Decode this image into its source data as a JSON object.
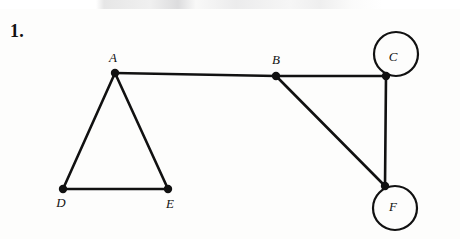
{
  "figure": {
    "problem_number": "1.",
    "type": "undirected-graph-diagram",
    "ink_color": "#111111",
    "background_color": "#fdfdfc"
  },
  "graph": {
    "vertices": [
      {
        "id": "A",
        "label": "A",
        "x": 115,
        "y": 73,
        "label_x": 113,
        "label_y": 62,
        "label_anchor": "middle",
        "loop": false
      },
      {
        "id": "B",
        "label": "B",
        "x": 276,
        "y": 76,
        "label_x": 276,
        "label_y": 64,
        "label_anchor": "middle",
        "loop": false
      },
      {
        "id": "C",
        "label": "C",
        "x": 386,
        "y": 76,
        "label_x": 393,
        "label_y": 61,
        "label_anchor": "middle",
        "loop": true,
        "loop_cx": 396,
        "loop_cy": 54,
        "loop_r": 22
      },
      {
        "id": "D",
        "label": "D",
        "x": 63,
        "y": 189,
        "label_x": 61,
        "label_y": 207,
        "label_anchor": "middle",
        "loop": false
      },
      {
        "id": "E",
        "label": "E",
        "x": 168,
        "y": 189,
        "label_x": 170,
        "label_y": 208,
        "label_anchor": "middle",
        "loop": false
      },
      {
        "id": "F",
        "label": "F",
        "x": 385,
        "y": 186,
        "label_x": 393,
        "label_y": 211,
        "label_anchor": "middle",
        "loop": true,
        "loop_cx": 395,
        "loop_cy": 208,
        "loop_r": 22
      }
    ],
    "edges": [
      {
        "from": "A",
        "to": "B",
        "x1": 115,
        "y1": 73,
        "x2": 276,
        "y2": 76
      },
      {
        "from": "A",
        "to": "D",
        "x1": 115,
        "y1": 73,
        "x2": 63,
        "y2": 189
      },
      {
        "from": "A",
        "to": "E",
        "x1": 115,
        "y1": 73,
        "x2": 168,
        "y2": 189
      },
      {
        "from": "D",
        "to": "E",
        "x1": 63,
        "y1": 189,
        "x2": 168,
        "y2": 189
      },
      {
        "from": "B",
        "to": "C",
        "x1": 276,
        "y1": 76,
        "x2": 386,
        "y2": 76
      },
      {
        "from": "B",
        "to": "F",
        "x1": 276,
        "y1": 76,
        "x2": 385,
        "y2": 186
      },
      {
        "from": "C",
        "to": "F",
        "x1": 386,
        "y1": 76,
        "x2": 385,
        "y2": 186
      }
    ],
    "loops": [
      {
        "at": "C",
        "cx": 396,
        "cy": 54,
        "r": 22
      },
      {
        "at": "F",
        "cx": 395,
        "cy": 208,
        "r": 22
      }
    ],
    "vertex_dot_radius": 4.2,
    "edge_width": 2.6,
    "loop_width": 2.2
  }
}
